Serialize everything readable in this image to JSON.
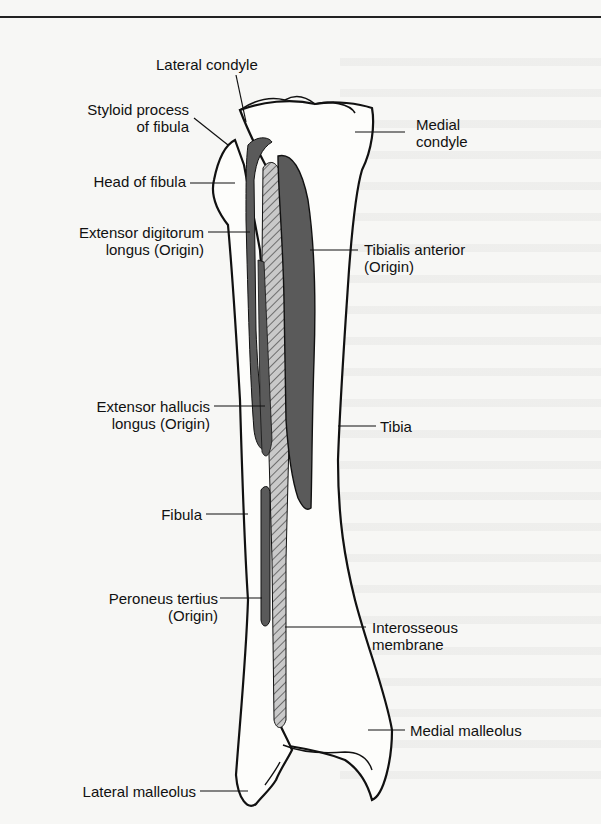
{
  "figure": {
    "colors": {
      "outline": "#111111",
      "muscle_fill": "#5a5a5a",
      "membrane_hatch": "#9a9a9a",
      "background": "#f7f7f5"
    },
    "labels": {
      "lateral_condyle": "Lateral condyle",
      "styloid_process_1": "Styloid process",
      "styloid_process_2": "of fibula",
      "medial_condyle_1": "Medial",
      "medial_condyle_2": "condyle",
      "head_of_fibula": "Head of fibula",
      "edl_1": "Extensor digitorum",
      "edl_2": "longus (Origin)",
      "tibialis_anterior_1": "Tibialis anterior",
      "tibialis_anterior_2": "(Origin)",
      "ehl_1": "Extensor hallucis",
      "ehl_2": "longus (Origin)",
      "tibia": "Tibia",
      "fibula": "Fibula",
      "peroneus_tertius_1": "Peroneus tertius",
      "peroneus_tertius_2": "(Origin)",
      "interosseous_1": "Interosseous",
      "interosseous_2": "membrane",
      "medial_malleolus": "Medial malleolus",
      "lateral_malleolus": "Lateral malleolus"
    }
  }
}
